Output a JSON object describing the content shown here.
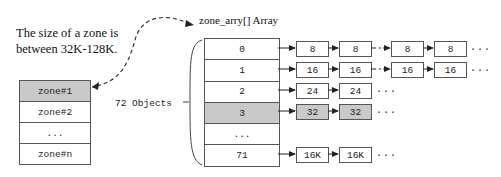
{
  "caption": {
    "line1": "The size of a zone is",
    "line2": "between 32K-128K."
  },
  "zone_list": {
    "rows": [
      {
        "label": "zone#1",
        "shaded": true
      },
      {
        "label": "zone#2",
        "shaded": false
      },
      {
        "label": "...",
        "shaded": false
      },
      {
        "label": "zone#n",
        "shaded": false
      }
    ]
  },
  "zone_array": {
    "title": "zone_arry[] Array",
    "count_label": "72 Objects",
    "rows": [
      {
        "index": "0",
        "shaded": false
      },
      {
        "index": "1",
        "shaded": false
      },
      {
        "index": "2",
        "shaded": false
      },
      {
        "index": "3",
        "shaded": true
      },
      {
        "index": "...",
        "shaded": false
      },
      {
        "index": "71",
        "shaded": false
      }
    ]
  },
  "chains": [
    {
      "row": "0",
      "nodes": [
        "8",
        "8",
        "8",
        "8"
      ],
      "gap_after": 2,
      "ellipsis": "..."
    },
    {
      "row": "1",
      "nodes": [
        "16",
        "16",
        "16",
        "16"
      ],
      "gap_after": 2,
      "ellipsis": "..."
    },
    {
      "row": "2",
      "nodes": [
        "24",
        "24"
      ],
      "ellipsis": "..."
    },
    {
      "row": "3",
      "nodes": [
        "32",
        "32"
      ],
      "shaded": true,
      "ellipsis": "..."
    },
    {
      "row": "...",
      "nodes": []
    },
    {
      "row": "71",
      "nodes": [
        "16K",
        "16K"
      ],
      "ellipsis": "..."
    }
  ]
}
